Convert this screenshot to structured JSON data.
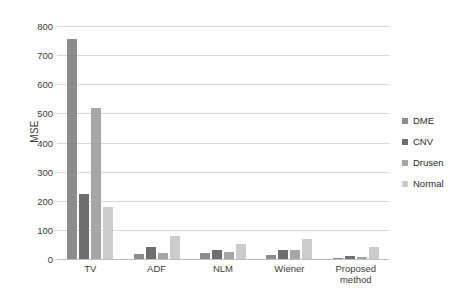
{
  "chart_data": {
    "type": "bar",
    "title": "",
    "xlabel": "",
    "ylabel": "MSE",
    "ylim": [
      0,
      800
    ],
    "yticks": [
      0,
      100,
      200,
      300,
      400,
      500,
      600,
      700,
      800
    ],
    "grid": true,
    "legend_position": "right",
    "categories": [
      "TV",
      "ADF",
      "NLM",
      "Wiener",
      "Proposed method"
    ],
    "series": [
      {
        "name": "DME",
        "color": "#8c8c8c",
        "values": [
          755,
          18,
          20,
          14,
          5
        ]
      },
      {
        "name": "CNV",
        "color": "#6e6e6e",
        "values": [
          222,
          42,
          32,
          30,
          10
        ]
      },
      {
        "name": "Drusen",
        "color": "#a6a6a6",
        "values": [
          520,
          22,
          25,
          32,
          8
        ]
      },
      {
        "name": "Normal",
        "color": "#cccccc",
        "values": [
          178,
          78,
          50,
          68,
          40
        ]
      }
    ]
  },
  "axis": {
    "y_title": "MSE",
    "y_tick_labels": [
      "800",
      "700",
      "600",
      "500",
      "400",
      "300",
      "200",
      "100",
      "0"
    ],
    "x_tick_labels": [
      "TV",
      "ADF",
      "NLM",
      "Wiener",
      "Proposed\nmethod"
    ]
  },
  "legend": {
    "items": [
      {
        "label": "DME",
        "swatch": "#8c8c8c"
      },
      {
        "label": "CNV",
        "swatch": "#6e6e6e"
      },
      {
        "label": "Drusen",
        "swatch": "#a6a6a6"
      },
      {
        "label": "Normal",
        "swatch": "#cccccc"
      }
    ]
  },
  "colors": {
    "gridline": "#d9d9d9",
    "baseline": "#bfbfbf",
    "background": "#ffffff",
    "text": "#3c3c3c"
  }
}
